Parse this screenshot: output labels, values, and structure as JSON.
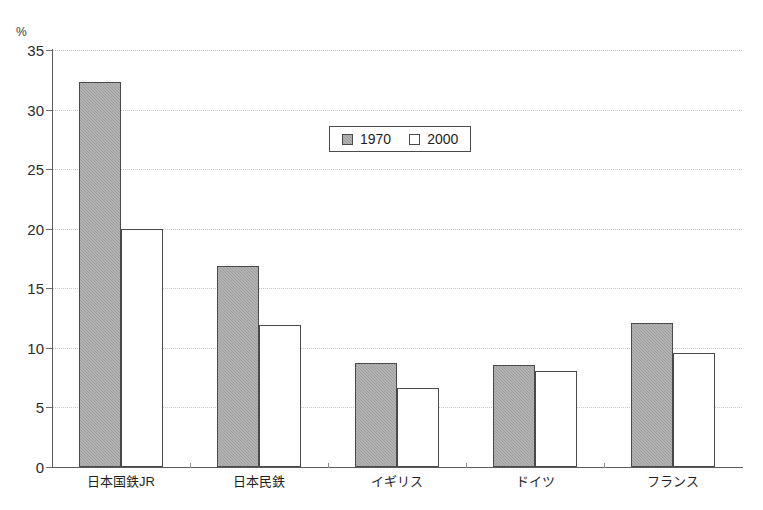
{
  "chart_data": {
    "type": "bar",
    "title": "",
    "subtitle": "",
    "xlabel": "",
    "ylabel": "%",
    "unit_label": "%",
    "ylim": [
      0,
      35
    ],
    "yticks": [
      0,
      5,
      10,
      15,
      20,
      25,
      30,
      35
    ],
    "ytick_labels": [
      "0",
      "5",
      "10",
      "15",
      "20",
      "25",
      "30",
      "35"
    ],
    "grid": true,
    "grid_axis": "y",
    "legend_position": "upper-center",
    "categories": [
      "日本国鉄JR",
      "日本民鉄",
      "イギリス",
      "ドイツ",
      "フランス"
    ],
    "series": [
      {
        "name": "1970",
        "color": "#9d9d9d",
        "values": [
          32.3,
          16.9,
          8.7,
          8.6,
          12.1
        ]
      },
      {
        "name": "2000",
        "color": "#ffffff",
        "values": [
          20.0,
          11.9,
          6.6,
          8.1,
          9.6
        ]
      }
    ]
  },
  "legend": {
    "entries": [
      {
        "label": "1970",
        "swatch": "filled-gray-square"
      },
      {
        "label": "2000",
        "swatch": "open-white-square"
      }
    ]
  },
  "colors": {
    "series_1970": "#9d9d9d",
    "series_2000": "#ffffff",
    "bar_border": "#4a4a4a",
    "axis": "#5b5b5b",
    "gridline": "#c9c9c9",
    "text": "#231f20",
    "background": "#ffffff"
  }
}
